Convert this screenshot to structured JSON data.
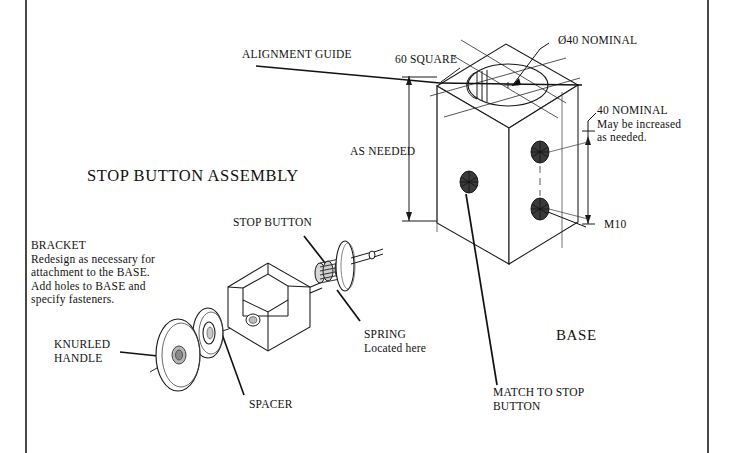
{
  "document": {
    "kind": "engineering-drawing",
    "background_color": "#ffffff",
    "ink_color": "#111111",
    "border": {
      "left_x": 26,
      "right_x": 708,
      "visible_sides": "left-and-right"
    }
  },
  "title": {
    "text": "STOP BUTTON ASSEMBLY"
  },
  "labels": {
    "alignment_guide": "ALIGNMENT GUIDE",
    "sixty_square": "60 SQUARE",
    "diameter_nominal": "Ø40 NOMINAL",
    "forty_nominal_line1": "40 NOMINAL",
    "forty_nominal_line2": "May be increased",
    "forty_nominal_line3": "as needed.",
    "as_needed": "AS NEEDED",
    "m10": "M10",
    "base": "BASE",
    "stop_button": "STOP BUTTON",
    "spring_line1": "SPRING",
    "spring_line2": "Located here",
    "spacer": "SPACER",
    "knurled_handle_line1": "KNURLED",
    "knurled_handle_line2": "HANDLE",
    "match_line1": "MATCH TO STOP",
    "match_line2": "BUTTON"
  },
  "bracket_note": {
    "heading": "BRACKET",
    "line1": "Redesign as necessary for",
    "line2": "attachment to the BASE.",
    "line3": "Add holes to BASE and",
    "line4": "specify fasteners."
  },
  "parts": [
    {
      "name": "base-block",
      "label": "BASE"
    },
    {
      "name": "bracket",
      "label": "BRACKET"
    },
    {
      "name": "stop-button",
      "label": "STOP BUTTON"
    },
    {
      "name": "spring",
      "label": "SPRING"
    },
    {
      "name": "spacer",
      "label": "SPACER"
    },
    {
      "name": "knurled-handle",
      "label": "KNURLED HANDLE"
    },
    {
      "name": "m10-fastener",
      "label": "M10"
    }
  ],
  "dimensions": [
    {
      "name": "top-width",
      "value": "60 SQUARE"
    },
    {
      "name": "bore-diameter",
      "value": "Ø40 NOMINAL"
    },
    {
      "name": "fastener-spacing",
      "value": "40 NOMINAL"
    },
    {
      "name": "height",
      "value": "AS NEEDED"
    }
  ]
}
